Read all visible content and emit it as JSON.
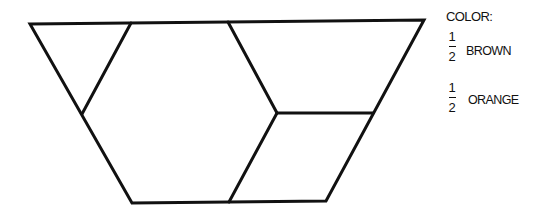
{
  "figure": {
    "type": "pattern-block-trapezoid",
    "stroke_color": "#111111",
    "outline": [
      [
        30,
        24
      ],
      [
        424,
        20
      ],
      [
        326,
        201
      ],
      [
        132,
        203
      ]
    ],
    "pieces": [
      {
        "shape": "triangle",
        "points": [
          [
            30,
            24
          ],
          [
            131,
            23
          ],
          [
            82,
            114
          ]
        ]
      },
      {
        "shape": "hexagon",
        "points": [
          [
            131,
            23
          ],
          [
            228,
            22
          ],
          [
            277,
            113
          ],
          [
            229,
            202
          ],
          [
            132,
            203
          ],
          [
            82,
            114
          ]
        ]
      },
      {
        "shape": "rhombus",
        "points": [
          [
            228,
            22
          ],
          [
            424,
            20
          ],
          [
            373,
            113
          ],
          [
            277,
            113
          ]
        ]
      },
      {
        "shape": "rhombus",
        "points": [
          [
            277,
            113
          ],
          [
            373,
            113
          ],
          [
            326,
            201
          ],
          [
            229,
            202
          ]
        ]
      }
    ]
  },
  "legend": {
    "title": "COLOR:",
    "items": [
      {
        "numerator": "1",
        "denominator": "2",
        "color_name": "BROWN"
      },
      {
        "numerator": "1",
        "denominator": "2",
        "color_name": "ORANGE"
      }
    ]
  }
}
